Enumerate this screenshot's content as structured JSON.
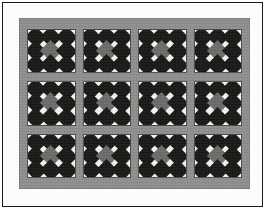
{
  "image": {
    "title": "Nine-Patch Diamond Quilt",
    "subject": "quilt",
    "width": 267,
    "height": 211
  },
  "frame": {
    "border_color": "#1a1a1a",
    "matte_color": "#fcfcfc",
    "border_label": "outer-photo-frame"
  },
  "quilt": {
    "sashing_color": "#8e8e8e",
    "block_background_color": "#f7f5f0",
    "dark_patch_color": "#171717",
    "center_patch_color": "#6b6b6b",
    "rows": 3,
    "columns": 4,
    "block_count": 12,
    "block_pattern_name": "nine-patch-diamond",
    "layout_label": "3 rows by 4 columns"
  },
  "block_template": {
    "patches": [
      "dark",
      "dark",
      "dark",
      "dark",
      "center",
      "dark",
      "dark",
      "dark",
      "dark"
    ],
    "patch_roles": {
      "dark": "dark-diamond",
      "center": "center-gray-diamond"
    }
  },
  "blocks": [
    {
      "row": 1,
      "col": 1,
      "name": "block-r1c1"
    },
    {
      "row": 1,
      "col": 2,
      "name": "block-r1c2"
    },
    {
      "row": 1,
      "col": 3,
      "name": "block-r1c3"
    },
    {
      "row": 1,
      "col": 4,
      "name": "block-r1c4"
    },
    {
      "row": 2,
      "col": 1,
      "name": "block-r2c1"
    },
    {
      "row": 2,
      "col": 2,
      "name": "block-r2c2"
    },
    {
      "row": 2,
      "col": 3,
      "name": "block-r2c3"
    },
    {
      "row": 2,
      "col": 4,
      "name": "block-r2c4"
    },
    {
      "row": 3,
      "col": 1,
      "name": "block-r3c1"
    },
    {
      "row": 3,
      "col": 2,
      "name": "block-r3c2"
    },
    {
      "row": 3,
      "col": 3,
      "name": "block-r3c3"
    },
    {
      "row": 3,
      "col": 4,
      "name": "block-r3c4"
    }
  ]
}
